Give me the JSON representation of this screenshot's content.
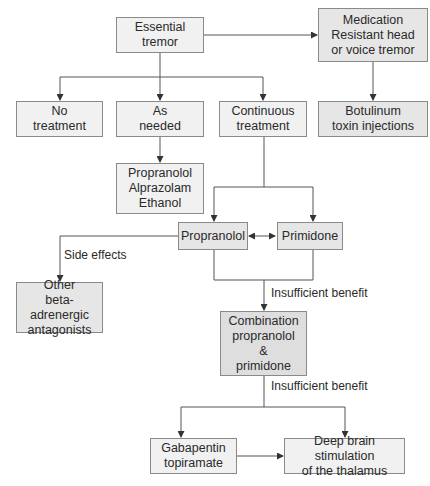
{
  "diagram": {
    "type": "flowchart",
    "nodes": {
      "essential_tremor": "Essential\ntremor",
      "medication_resistant": "Medication\nResistant head\nor voice tremor",
      "no_treatment": "No\ntreatment",
      "as_needed": "As\nneeded",
      "continuous_treatment": "Continuous\ntreatment",
      "botulinum": "Botulinum\ntoxin injections",
      "as_needed_drugs": "Propranolol\nAlprazolam\nEthanol",
      "propranolol": "Propranolol",
      "primidone": "Primidone",
      "other_beta": "Other\nbeta-adrenergic\nantagonists",
      "combination": "Combination\npropranolol\n&\nprimidone",
      "gabapentin": "Gabapentin\ntopiramate",
      "deep_brain": "Deep brain stimulation\nof the thalamus"
    },
    "edge_labels": {
      "side_effects": "Side effects",
      "insufficient_benefit_1": "Insufficient benefit",
      "insufficient_benefit_2": "Insufficient benefit"
    },
    "edges": [
      {
        "from": "essential_tremor",
        "to": "medication_resistant"
      },
      {
        "from": "essential_tremor",
        "to": "no_treatment"
      },
      {
        "from": "essential_tremor",
        "to": "as_needed"
      },
      {
        "from": "essential_tremor",
        "to": "continuous_treatment"
      },
      {
        "from": "medication_resistant",
        "to": "botulinum"
      },
      {
        "from": "as_needed",
        "to": "as_needed_drugs"
      },
      {
        "from": "continuous_treatment",
        "to": "propranolol"
      },
      {
        "from": "continuous_treatment",
        "to": "primidone"
      },
      {
        "from": "propranolol",
        "to": "primidone",
        "bidirectional": true
      },
      {
        "from": "propranolol",
        "to": "other_beta",
        "label": "Side effects"
      },
      {
        "from": "propranolol+primidone",
        "to": "combination",
        "label": "Insufficient benefit"
      },
      {
        "from": "combination",
        "to": "gabapentin",
        "label": "Insufficient benefit"
      },
      {
        "from": "combination",
        "to": "deep_brain",
        "label": "Insufficient benefit"
      },
      {
        "from": "gabapentin",
        "to": "deep_brain"
      }
    ]
  }
}
